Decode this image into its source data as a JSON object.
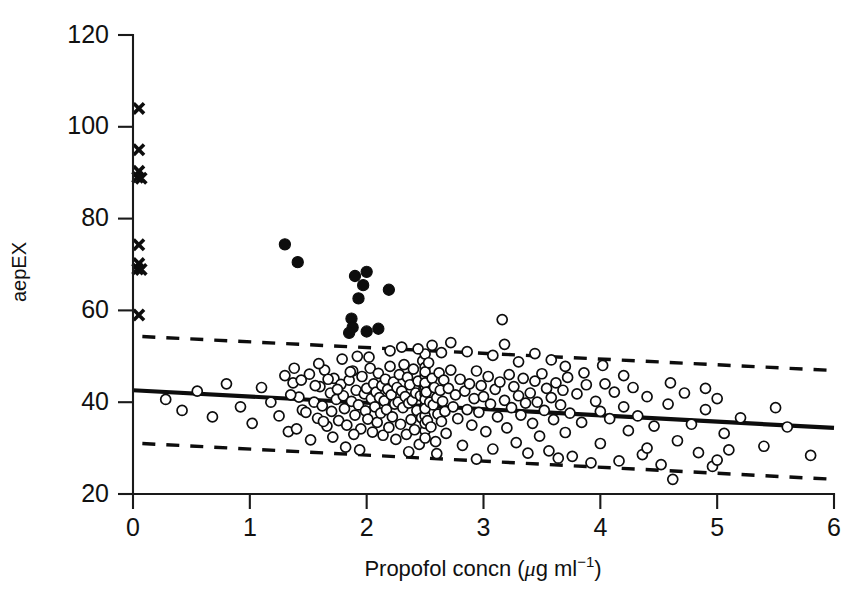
{
  "chart_data": {
    "type": "scatter",
    "title": "",
    "xlabel": "Propofol concn",
    "xlabel_units_prefix": "(",
    "xlabel_units_mu": "μ",
    "xlabel_units_g": "g ml",
    "xlabel_units_exp": "−1",
    "xlabel_units_suffix": ")",
    "xlabel_full": "Propofol concn (μg ml−1)",
    "ylabel": "aepEX",
    "xlim": [
      0,
      6
    ],
    "ylim": [
      20,
      120
    ],
    "xticks": [
      0,
      1,
      2,
      3,
      4,
      5,
      6
    ],
    "xtick_labels": [
      "0",
      "1",
      "2",
      "3",
      "4",
      "5",
      "6"
    ],
    "yticks": [
      20,
      40,
      60,
      80,
      100,
      120
    ],
    "ytick_labels": [
      "20",
      "40",
      "60",
      "80",
      "100",
      "120"
    ],
    "grid": false,
    "legend": "none",
    "series": [
      {
        "name": "awake-crosses",
        "marker": "cross",
        "color": "#0d0d0d",
        "points": [
          [
            0.05,
            104.0
          ],
          [
            0.05,
            95.0
          ],
          [
            0.05,
            90.3
          ],
          [
            0.04,
            89.0
          ],
          [
            0.07,
            88.8
          ],
          [
            0.05,
            74.3
          ],
          [
            0.05,
            70.2
          ],
          [
            0.04,
            69.0
          ],
          [
            0.07,
            68.9
          ],
          [
            0.05,
            59.0
          ]
        ]
      },
      {
        "name": "filled-circles",
        "marker": "filled-circle",
        "color": "#0d0d0d",
        "points": [
          [
            1.3,
            74.4
          ],
          [
            1.41,
            70.5
          ],
          [
            1.9,
            67.5
          ],
          [
            2.0,
            68.4
          ],
          [
            1.97,
            65.5
          ],
          [
            2.19,
            64.5
          ],
          [
            1.93,
            62.6
          ],
          [
            1.87,
            58.2
          ],
          [
            1.88,
            56.3
          ],
          [
            2.0,
            55.4
          ],
          [
            1.85,
            55.1
          ],
          [
            2.1,
            56.0
          ]
        ]
      },
      {
        "name": "open-circles",
        "marker": "open-circle",
        "color": "#0d0d0d",
        "points": [
          [
            1.37,
            44.2
          ],
          [
            1.42,
            41.1
          ],
          [
            1.45,
            38.3
          ],
          [
            1.51,
            46.1
          ],
          [
            1.55,
            40.0
          ],
          [
            1.58,
            36.5
          ],
          [
            1.6,
            43.4
          ],
          [
            1.62,
            39.2
          ],
          [
            1.64,
            47.0
          ],
          [
            1.66,
            34.8
          ],
          [
            1.69,
            42.0
          ],
          [
            1.7,
            38.0
          ],
          [
            1.72,
            45.2
          ],
          [
            1.74,
            40.6
          ],
          [
            1.76,
            36.0
          ],
          [
            1.78,
            43.9
          ],
          [
            1.8,
            41.4
          ],
          [
            1.81,
            38.6
          ],
          [
            1.83,
            35.0
          ],
          [
            1.85,
            44.8
          ],
          [
            1.87,
            40.2
          ],
          [
            1.88,
            46.8
          ],
          [
            1.9,
            37.2
          ],
          [
            1.91,
            42.6
          ],
          [
            1.93,
            39.4
          ],
          [
            1.95,
            34.2
          ],
          [
            1.96,
            45.6
          ],
          [
            1.98,
            41.8
          ],
          [
            1.99,
            38.1
          ],
          [
            2.0,
            43.0
          ],
          [
            2.01,
            36.3
          ],
          [
            2.03,
            47.4
          ],
          [
            2.04,
            40.8
          ],
          [
            2.05,
            33.5
          ],
          [
            2.06,
            44.0
          ],
          [
            2.07,
            39.0
          ],
          [
            2.08,
            42.2
          ],
          [
            2.09,
            35.6
          ],
          [
            2.1,
            46.3
          ],
          [
            2.11,
            41.0
          ],
          [
            2.12,
            37.6
          ],
          [
            2.13,
            43.6
          ],
          [
            2.14,
            32.8
          ],
          [
            2.15,
            40.3
          ],
          [
            2.16,
            45.0
          ],
          [
            2.17,
            38.4
          ],
          [
            2.18,
            42.8
          ],
          [
            2.19,
            34.5
          ],
          [
            2.2,
            47.8
          ],
          [
            2.21,
            41.6
          ],
          [
            2.22,
            36.8
          ],
          [
            2.23,
            44.4
          ],
          [
            2.24,
            39.6
          ],
          [
            2.25,
            31.9
          ],
          [
            2.26,
            43.2
          ],
          [
            2.27,
            40.0
          ],
          [
            2.28,
            46.0
          ],
          [
            2.29,
            35.2
          ],
          [
            2.3,
            42.4
          ],
          [
            2.31,
            38.8
          ],
          [
            2.32,
            48.2
          ],
          [
            2.33,
            41.2
          ],
          [
            2.34,
            33.0
          ],
          [
            2.35,
            45.4
          ],
          [
            2.36,
            39.8
          ],
          [
            2.37,
            43.8
          ],
          [
            2.38,
            36.2
          ],
          [
            2.39,
            40.4
          ],
          [
            2.4,
            47.2
          ],
          [
            2.41,
            34.0
          ],
          [
            2.42,
            42.0
          ],
          [
            2.43,
            38.2
          ],
          [
            2.44,
            44.6
          ],
          [
            2.45,
            30.8
          ],
          [
            2.46,
            41.4
          ],
          [
            2.47,
            36.6
          ],
          [
            2.48,
            49.0
          ],
          [
            2.49,
            43.0
          ],
          [
            2.5,
            39.2
          ],
          [
            2.5,
            45.8
          ],
          [
            2.5,
            33.8
          ],
          [
            2.5,
            41.8
          ],
          [
            2.5,
            37.0
          ],
          [
            2.5,
            47.6
          ],
          [
            2.5,
            35.4
          ],
          [
            2.5,
            43.4
          ],
          [
            2.5,
            50.5
          ],
          [
            2.5,
            40.6
          ],
          [
            2.5,
            32.2
          ],
          [
            2.5,
            46.6
          ],
          [
            2.5,
            38.6
          ],
          [
            2.5,
            44.2
          ],
          [
            2.51,
            42.2
          ],
          [
            2.52,
            36.0
          ],
          [
            2.53,
            48.6
          ],
          [
            2.54,
            40.0
          ],
          [
            2.55,
            34.6
          ],
          [
            2.56,
            45.2
          ],
          [
            2.57,
            39.4
          ],
          [
            2.58,
            43.2
          ],
          [
            2.59,
            31.4
          ],
          [
            2.6,
            41.0
          ],
          [
            2.61,
            37.4
          ],
          [
            2.62,
            46.4
          ],
          [
            2.63,
            42.6
          ],
          [
            2.64,
            35.8
          ],
          [
            2.65,
            40.2
          ],
          [
            2.66,
            44.8
          ],
          [
            2.67,
            38.0
          ],
          [
            2.68,
            33.2
          ],
          [
            2.7,
            43.0
          ],
          [
            2.72,
            47.0
          ],
          [
            2.74,
            39.0
          ],
          [
            2.76,
            41.6
          ],
          [
            2.78,
            36.4
          ],
          [
            2.8,
            45.0
          ],
          [
            2.82,
            30.6
          ],
          [
            2.84,
            42.4
          ],
          [
            2.86,
            38.4
          ],
          [
            2.88,
            44.0
          ],
          [
            2.9,
            35.0
          ],
          [
            2.92,
            40.8
          ],
          [
            2.94,
            46.8
          ],
          [
            2.96,
            37.8
          ],
          [
            2.98,
            43.6
          ],
          [
            3.0,
            41.2
          ],
          [
            3.02,
            33.6
          ],
          [
            3.04,
            45.6
          ],
          [
            3.06,
            39.6
          ],
          [
            3.08,
            29.8
          ],
          [
            3.1,
            42.8
          ],
          [
            3.12,
            36.8
          ],
          [
            3.14,
            44.4
          ],
          [
            3.16,
            58.0
          ],
          [
            3.18,
            40.4
          ],
          [
            3.2,
            34.4
          ],
          [
            3.22,
            46.0
          ],
          [
            3.24,
            38.8
          ],
          [
            3.26,
            43.4
          ],
          [
            3.28,
            31.2
          ],
          [
            3.3,
            41.4
          ],
          [
            3.32,
            37.2
          ],
          [
            3.34,
            45.2
          ],
          [
            3.36,
            39.8
          ],
          [
            3.38,
            28.9
          ],
          [
            3.4,
            42.0
          ],
          [
            3.42,
            35.4
          ],
          [
            3.44,
            44.6
          ],
          [
            3.46,
            40.0
          ],
          [
            3.48,
            32.6
          ],
          [
            3.5,
            46.2
          ],
          [
            3.52,
            38.2
          ],
          [
            3.54,
            43.0
          ],
          [
            3.56,
            29.4
          ],
          [
            3.58,
            41.0
          ],
          [
            3.6,
            36.2
          ],
          [
            3.62,
            44.2
          ],
          [
            3.64,
            27.8
          ],
          [
            3.66,
            39.4
          ],
          [
            3.68,
            42.6
          ],
          [
            3.7,
            33.4
          ],
          [
            3.72,
            45.4
          ],
          [
            3.74,
            37.6
          ],
          [
            3.76,
            28.2
          ],
          [
            3.8,
            41.8
          ],
          [
            3.84,
            35.6
          ],
          [
            3.88,
            43.8
          ],
          [
            3.92,
            26.8
          ],
          [
            3.96,
            40.2
          ],
          [
            4.0,
            38.0
          ],
          [
            4.0,
            31.0
          ],
          [
            4.04,
            44.0
          ],
          [
            4.08,
            36.4
          ],
          [
            4.12,
            42.2
          ],
          [
            4.16,
            27.2
          ],
          [
            4.2,
            39.0
          ],
          [
            4.24,
            33.8
          ],
          [
            4.28,
            43.2
          ],
          [
            4.32,
            37.0
          ],
          [
            4.36,
            28.6
          ],
          [
            4.4,
            41.2
          ],
          [
            4.46,
            34.8
          ],
          [
            4.52,
            26.4
          ],
          [
            4.58,
            39.6
          ],
          [
            4.62,
            23.2
          ],
          [
            4.66,
            31.6
          ],
          [
            4.72,
            42.0
          ],
          [
            4.78,
            35.2
          ],
          [
            4.84,
            29.0
          ],
          [
            4.9,
            38.4
          ],
          [
            4.96,
            26.0
          ],
          [
            5.0,
            40.8
          ],
          [
            5.0,
            27.4
          ],
          [
            5.06,
            33.2
          ],
          [
            5.2,
            36.6
          ],
          [
            5.4,
            30.4
          ],
          [
            5.6,
            34.6
          ],
          [
            5.8,
            28.4
          ],
          [
            0.28,
            40.6
          ],
          [
            0.42,
            38.2
          ],
          [
            0.55,
            42.4
          ],
          [
            0.68,
            36.8
          ],
          [
            0.8,
            44.0
          ],
          [
            0.92,
            39.0
          ],
          [
            1.02,
            35.4
          ],
          [
            1.1,
            43.2
          ],
          [
            1.18,
            40.0
          ],
          [
            1.25,
            37.0
          ],
          [
            1.3,
            45.8
          ],
          [
            1.33,
            33.6
          ],
          [
            1.35,
            41.6
          ],
          [
            1.38,
            47.4
          ],
          [
            1.4,
            34.2
          ],
          [
            1.44,
            44.8
          ],
          [
            1.48,
            37.8
          ],
          [
            1.52,
            31.8
          ],
          [
            1.56,
            43.6
          ],
          [
            1.59,
            48.4
          ],
          [
            1.63,
            35.8
          ],
          [
            1.67,
            45.0
          ],
          [
            1.71,
            32.4
          ],
          [
            1.75,
            42.8
          ],
          [
            1.79,
            49.4
          ],
          [
            1.82,
            30.2
          ],
          [
            1.86,
            46.6
          ],
          [
            1.89,
            33.0
          ],
          [
            1.92,
            50.0
          ],
          [
            1.94,
            29.6
          ],
          [
            2.02,
            49.8
          ],
          [
            2.2,
            51.2
          ],
          [
            2.3,
            52.0
          ],
          [
            2.36,
            29.2
          ],
          [
            2.44,
            51.6
          ],
          [
            2.56,
            52.4
          ],
          [
            2.6,
            28.8
          ],
          [
            2.64,
            50.8
          ],
          [
            2.72,
            53.0
          ],
          [
            2.86,
            51.0
          ],
          [
            2.94,
            27.6
          ],
          [
            3.08,
            50.2
          ],
          [
            3.18,
            52.6
          ],
          [
            3.3,
            48.8
          ],
          [
            3.44,
            50.6
          ],
          [
            3.58,
            49.2
          ],
          [
            3.7,
            47.8
          ],
          [
            3.86,
            46.4
          ],
          [
            4.02,
            48.0
          ],
          [
            4.2,
            45.8
          ],
          [
            4.4,
            30.0
          ],
          [
            4.6,
            44.2
          ],
          [
            4.9,
            43.0
          ],
          [
            5.1,
            29.6
          ],
          [
            5.5,
            38.8
          ]
        ]
      }
    ],
    "fit_line": {
      "name": "regression-line",
      "style": "solid",
      "x": [
        0.0,
        6.0
      ],
      "y": [
        42.6,
        34.4
      ]
    },
    "prediction_bands": [
      {
        "name": "upper-prediction-band",
        "style": "dashed",
        "x": [
          0.08,
          6.0
        ],
        "y": [
          54.3,
          46.9
        ]
      },
      {
        "name": "lower-prediction-band",
        "style": "dashed",
        "x": [
          0.08,
          6.0
        ],
        "y": [
          31.0,
          23.2
        ]
      }
    ]
  }
}
